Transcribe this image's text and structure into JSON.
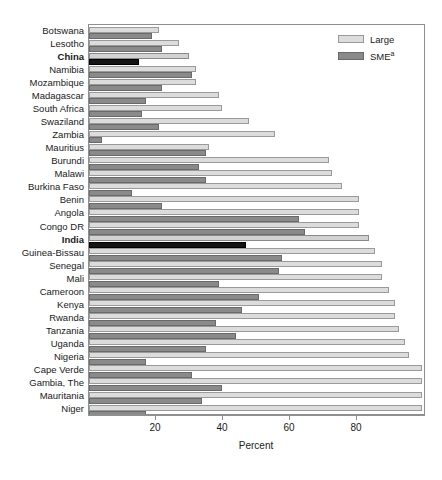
{
  "chart_data": {
    "type": "bar",
    "orientation": "horizontal",
    "title": "",
    "xlabel": "Percent",
    "ylabel": "",
    "xlim": [
      0,
      100.6
    ],
    "xticks": [
      20,
      40,
      60,
      80
    ],
    "grid": false,
    "legend_position": "top-right",
    "categories": [
      "Botswana",
      "Lesotho",
      "China",
      "Namibia",
      "Mozambique",
      "Madagascar",
      "South Africa",
      "Swaziland",
      "Zambia",
      "Mauritius",
      "Burundi",
      "Malawi",
      "Burkina Faso",
      "Benin",
      "Angola",
      "Congo DR",
      "India",
      "Guinea-Bissau",
      "Senegal",
      "Mali",
      "Cameroon",
      "Kenya",
      "Rwanda",
      "Tanzania",
      "Uganda",
      "Nigeria",
      "Cape Verde",
      "Gambia, The",
      "Mauritania",
      "Niger"
    ],
    "highlighted_categories": [
      "China",
      "India"
    ],
    "series": [
      {
        "name": "Large",
        "color": "#dcdcdc",
        "values": [
          21,
          27,
          30,
          32,
          32,
          39,
          40,
          48,
          56,
          36,
          72,
          73,
          76,
          81,
          81,
          81,
          84,
          86,
          88,
          88,
          90,
          92,
          92,
          93,
          95,
          96,
          100,
          100,
          100,
          100
        ]
      },
      {
        "name": "SME",
        "superscript": "a",
        "color": "#8a8a8a",
        "values": [
          19,
          22,
          15,
          31,
          22,
          17,
          16,
          21,
          4,
          35,
          33,
          35,
          13,
          22,
          63,
          65,
          47,
          58,
          57,
          39,
          51,
          46,
          38,
          44,
          35,
          17,
          31,
          40,
          34,
          17
        ]
      }
    ]
  },
  "legend": {
    "items": [
      {
        "label": "Large",
        "swatch": "large"
      },
      {
        "label": "SME",
        "superscript": "a",
        "swatch": "sme"
      }
    ]
  },
  "axis": {
    "x_title": "Percent",
    "tick_labels": [
      "20",
      "40",
      "60",
      "80"
    ]
  }
}
